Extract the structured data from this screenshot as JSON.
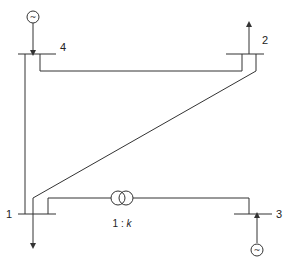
{
  "diagram": {
    "buses": [
      {
        "id": "1",
        "label": "1",
        "device": "load"
      },
      {
        "id": "2",
        "label": "2",
        "device": "load"
      },
      {
        "id": "3",
        "label": "3",
        "device": "generator"
      },
      {
        "id": "4",
        "label": "4",
        "device": "generator"
      }
    ],
    "branches": [
      {
        "from": "4",
        "to": "1",
        "type": "line"
      },
      {
        "from": "4",
        "to": "2",
        "type": "line"
      },
      {
        "from": "2",
        "to": "1",
        "type": "line"
      },
      {
        "from": "1",
        "to": "3",
        "type": "transformer"
      }
    ],
    "transformer": {
      "ratio_label_prefix": "1 : ",
      "ratio_label_k": "k"
    },
    "generator_symbol": "~",
    "colors": {
      "line": "#333333",
      "background": "#ffffff"
    }
  }
}
